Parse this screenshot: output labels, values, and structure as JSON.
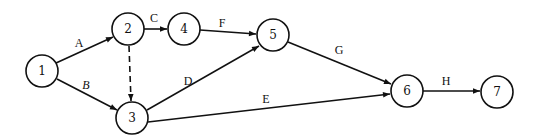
{
  "diagram": {
    "type": "activity-on-arrow network",
    "nodes": [
      {
        "id": "1",
        "label": "1",
        "x": 42,
        "y": 71
      },
      {
        "id": "2",
        "label": "2",
        "x": 128,
        "y": 29
      },
      {
        "id": "3",
        "label": "3",
        "x": 132,
        "y": 118
      },
      {
        "id": "4",
        "label": "4",
        "x": 184,
        "y": 29
      },
      {
        "id": "5",
        "label": "5",
        "x": 273,
        "y": 35
      },
      {
        "id": "6",
        "label": "6",
        "x": 407,
        "y": 91
      },
      {
        "id": "7",
        "label": "7",
        "x": 497,
        "y": 92
      }
    ],
    "edges": [
      {
        "from": "1",
        "to": "2",
        "label": "A",
        "style": "solid"
      },
      {
        "from": "1",
        "to": "3",
        "label": "B",
        "style": "solid"
      },
      {
        "from": "2",
        "to": "4",
        "label": "C",
        "style": "solid"
      },
      {
        "from": "2",
        "to": "3",
        "label": "",
        "style": "dashed"
      },
      {
        "from": "3",
        "to": "5",
        "label": "D",
        "style": "solid"
      },
      {
        "from": "3",
        "to": "6",
        "label": "E",
        "style": "solid"
      },
      {
        "from": "4",
        "to": "5",
        "label": "F",
        "style": "solid"
      },
      {
        "from": "5",
        "to": "6",
        "label": "G",
        "style": "solid"
      },
      {
        "from": "6",
        "to": "7",
        "label": "H",
        "style": "solid"
      }
    ],
    "edge_labels": {
      "A": "A",
      "B": "B",
      "C": "C",
      "D": "D",
      "E": "E",
      "F": "F",
      "G": "G",
      "H": "H"
    },
    "node_labels": {
      "n1": "1",
      "n2": "2",
      "n3": "3",
      "n4": "4",
      "n5": "5",
      "n6": "6",
      "n7": "7"
    },
    "colors": {
      "stroke": "#111111",
      "background": "#ffffff"
    }
  }
}
